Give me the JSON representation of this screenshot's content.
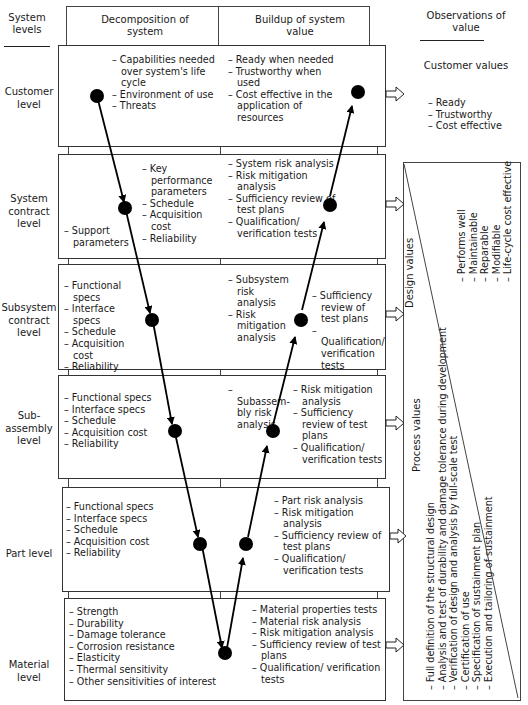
{
  "headers": {
    "system_levels": "System levels",
    "decomposition": "Decomposition of system",
    "buildup": "Buildup of system value",
    "observations": "Observations of value"
  },
  "levels": [
    {
      "name": "Customer level",
      "decomposition": [
        "Capabilities needed over system's life cycle",
        "Environment of use",
        "Threats"
      ],
      "decomposition_left": [],
      "buildup": [
        "Ready when needed",
        "Trustworthy when used",
        "Cost effective in the application of resources"
      ],
      "buildup_right": []
    },
    {
      "name": "System contract level",
      "decomposition_left": [
        "Support parameters"
      ],
      "decomposition": [
        "Key performance parameters",
        "Schedule",
        "Acquisition cost",
        "Reliability"
      ],
      "buildup": [
        "System risk analysis",
        "Risk mitigation analysis",
        "Sufficiency review of test plans",
        "Qualification/ verification tests"
      ],
      "buildup_right": []
    },
    {
      "name": "Subsystem contract level",
      "decomposition": [
        "Functional specs",
        "Interface specs",
        "Schedule",
        "Acquisition cost",
        "Reliability"
      ],
      "decomposition_left": [],
      "buildup": [
        "Subsystem risk analysis",
        "Risk mitigation analysis"
      ],
      "buildup_right": [
        "Sufficiency review of test plans",
        "Qualification/ verification tests"
      ]
    },
    {
      "name": "Sub-assembly level",
      "decomposition": [
        "Functional specs",
        "Interface specs",
        "Schedule",
        "Acquisition cost",
        "Reliability"
      ],
      "decomposition_left": [],
      "buildup": [
        "Subassem-bly risk analysis"
      ],
      "buildup_right": [
        "Risk mitigation analysis",
        "Sufficiency review of test plans",
        "Qualification/ verification tests"
      ]
    },
    {
      "name": "Part level",
      "decomposition": [
        "Functional specs",
        "Interface specs",
        "Schedule",
        "Acquisition cost",
        "Reliability"
      ],
      "decomposition_left": [],
      "buildup": [],
      "buildup_right": [
        "Part risk analysis",
        "Risk mitigation analysis",
        "Sufficiency review of test plans",
        "Qualification/ verification tests"
      ]
    },
    {
      "name": "Material level",
      "decomposition": [
        "Strength",
        "Durability",
        "Damage tolerance",
        "Corrosion resistance",
        "Elasticity",
        "Thermal sensitivity",
        "Other sensitivities of interest"
      ],
      "decomposition_left": [],
      "buildup": [
        "Material properties tests",
        "Material risk analysis",
        "Risk mitigation analysis",
        "Sufficiency review of test plans",
        "Qualification/ verification tests"
      ],
      "buildup_right": []
    }
  ],
  "customer_values": {
    "title": "Customer values",
    "items": [
      "Ready",
      "Trustworthy",
      "Cost effective"
    ]
  },
  "design_values": {
    "title": "Design values",
    "items": [
      "Performs well",
      "Maintainable",
      "Reparable",
      "Modifiable",
      "Life-cycle cost effective"
    ]
  },
  "process_values": {
    "title": "Process values",
    "items": [
      "Full definition of the structural design",
      "Analysis and test of durability and damage tolerance during development",
      "Verification of design and analysis by full-scale test",
      "Certification of use",
      "Specification of sustainment plan",
      "Execution and tailoring of sustainment"
    ]
  }
}
